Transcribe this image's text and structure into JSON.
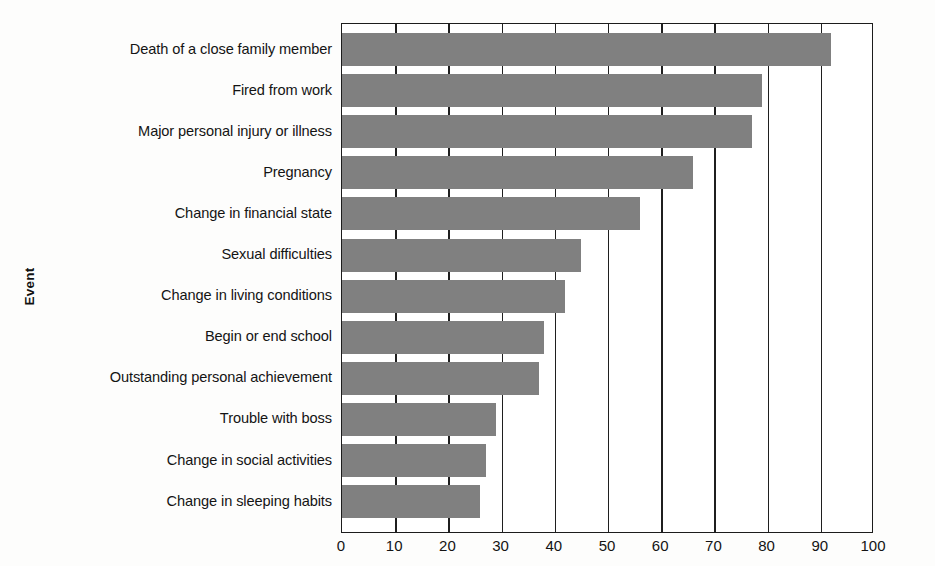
{
  "chart_data": {
    "type": "bar",
    "orientation": "horizontal",
    "title": "",
    "xlabel": "",
    "ylabel": "Event",
    "xlim": [
      0,
      100
    ],
    "xticks": [
      0,
      10,
      20,
      30,
      40,
      50,
      60,
      70,
      80,
      90,
      100
    ],
    "grid": true,
    "legend": false,
    "bar_color": "#808080",
    "axis_color": "#1c1c1c",
    "categories": [
      "Death of a close family member",
      "Fired from work",
      "Major personal injury or illness",
      "Pregnancy",
      "Change in financial state",
      "Sexual difficulties",
      "Change in living conditions",
      "Begin or end school",
      "Outstanding personal achievement",
      "Trouble with boss",
      "Change in social activities",
      "Change in sleeping habits"
    ],
    "values": [
      92,
      79,
      77,
      66,
      56,
      45,
      42,
      38,
      37,
      29,
      27,
      26
    ]
  },
  "axis": {
    "y_title": "Event",
    "x_tick_labels": [
      "0",
      "10",
      "20",
      "30",
      "40",
      "50",
      "60",
      "70",
      "80",
      "90",
      "100"
    ]
  }
}
